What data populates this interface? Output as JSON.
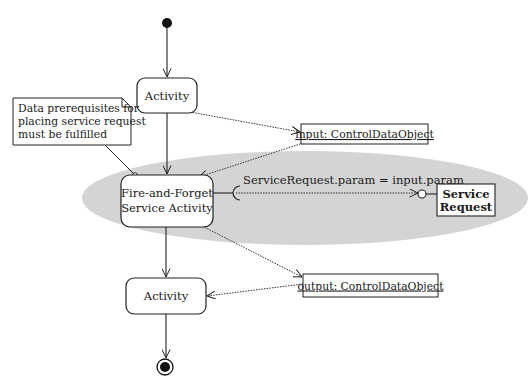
{
  "diagram": {
    "type": "UML activity diagram",
    "colors": {
      "background": "#ffffff",
      "highlight_region": "#d4d4d4",
      "stroke": "#222222",
      "text": "#1a1a1a"
    },
    "nodes": {
      "initial": {
        "label": "initial-node"
      },
      "activity_top": {
        "label": "Activity"
      },
      "fire_and_forget": {
        "line1": "Fire-and-Forget",
        "line2": "Service Activity"
      },
      "activity_bottom": {
        "label": "Activity"
      },
      "final": {
        "label": "final-node"
      }
    },
    "objects": {
      "input": {
        "label": "input: ControlDataObject"
      },
      "output": {
        "label": "output: ControlDataObject"
      }
    },
    "service": {
      "line1": "Service",
      "line2": "Request"
    },
    "note": {
      "line1": "Data prerequisites for",
      "line2": "placing service request",
      "line3": "must be fulfilled"
    },
    "edges": {
      "service_call": {
        "label": "ServiceRequest.param = input.param"
      }
    }
  }
}
